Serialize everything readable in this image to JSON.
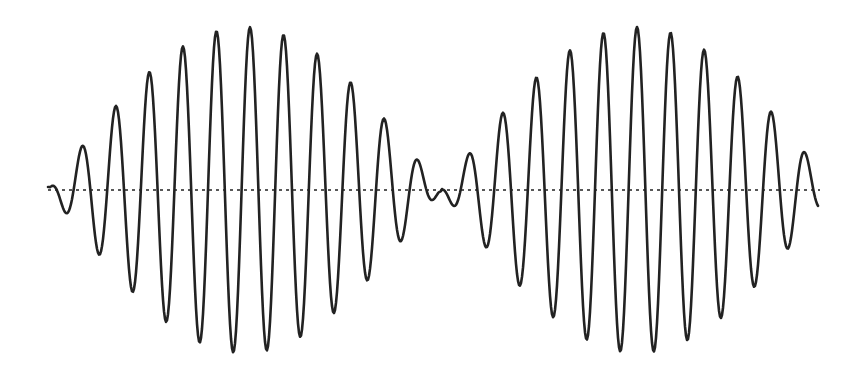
{
  "chart_data": {
    "type": "line",
    "title": "",
    "subtitle": "",
    "xlabel": "",
    "ylabel": "",
    "grid": false,
    "legend": null,
    "description": "Beat waveform: a high-frequency carrier whose amplitude is modulated by a slowly varying envelope, producing two lobes with a null in the center. A dotted horizontal zero/baseline runs through the middle.",
    "axes_visible": false,
    "baseline": {
      "style": "dotted",
      "y_px": 190,
      "x_start_px": 48,
      "x_end_px": 820,
      "color": "#222222"
    },
    "waveform": {
      "color": "#222222",
      "stroke_width": 2.6,
      "x_start_px": 48,
      "x_end_px": 818,
      "carrier_period_px": 33.6,
      "envelope_null_px": [
        48,
        441,
        834
      ],
      "envelope_amplitude_px": 163,
      "lobes": [
        {
          "x_from": 48,
          "x_to": 441,
          "carrier_peak_ref_px": 250
        },
        {
          "x_from": 441,
          "x_to": 818,
          "carrier_peak_ref_px": 637
        }
      ]
    },
    "measured_points_px": {
      "left_lobe_peaks": [
        [
          82,
          147
        ],
        [
          115,
          110
        ],
        [
          148,
          78
        ],
        [
          181,
          52
        ],
        [
          215,
          30
        ],
        [
          250,
          24
        ],
        [
          284,
          33
        ],
        [
          318,
          52
        ],
        [
          351,
          78
        ],
        [
          385,
          108
        ],
        [
          417,
          164
        ]
      ],
      "left_lobe_troughs": [
        [
          66,
          212
        ],
        [
          99,
          253
        ],
        [
          133,
          292
        ],
        [
          167,
          325
        ],
        [
          201,
          345
        ],
        [
          236,
          348
        ],
        [
          268,
          345
        ],
        [
          302,
          337
        ],
        [
          335,
          312
        ],
        [
          369,
          278
        ],
        [
          401,
          236
        ]
      ],
      "center_null": [
        [
          431,
          197
        ],
        [
          441,
          189
        ],
        [
          453,
          208
        ]
      ],
      "right_lobe_peaks": [
        [
          469,
          152
        ],
        [
          503,
          117
        ],
        [
          536,
          80
        ],
        [
          570,
          45
        ],
        [
          604,
          30
        ],
        [
          637,
          30
        ],
        [
          670,
          40
        ],
        [
          703,
          52
        ],
        [
          737,
          80
        ],
        [
          770,
          116
        ],
        [
          803,
          159
        ]
      ],
      "right_lobe_troughs": [
        [
          487,
          248
        ],
        [
          520,
          282
        ],
        [
          553,
          314
        ],
        [
          587,
          336
        ],
        [
          620,
          352
        ],
        [
          654,
          354
        ],
        [
          688,
          340
        ],
        [
          721,
          312
        ],
        [
          754,
          278
        ],
        [
          786,
          242
        ]
      ]
    },
    "x": "pixel position 48 to 818",
    "series": [
      {
        "name": "beat signal",
        "values": "sampled from envelope * carrier model (see waveform)"
      }
    ]
  }
}
